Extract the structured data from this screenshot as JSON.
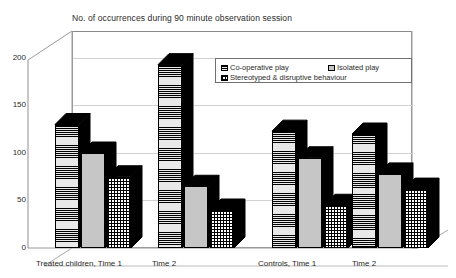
{
  "chart_data": {
    "type": "bar",
    "title": "No. of occurrences during 90 minute observation session",
    "xlabel": "",
    "ylabel": "",
    "ylim": [
      0,
      200
    ],
    "yticks": [
      0,
      50,
      100,
      150,
      200
    ],
    "grid": true,
    "legend_position": "top-right-inside",
    "style": "3d-clustered-column",
    "categories": [
      "Treated children, Time 1",
      "Time 2",
      "Controls, Time 1",
      "Time 2"
    ],
    "series": [
      {
        "name": "Co-operative play",
        "pattern": "horizontal-lines",
        "values": [
          130,
          193,
          123,
          120
        ]
      },
      {
        "name": "Isolated play",
        "pattern": "solid-grey",
        "values": [
          100,
          65,
          95,
          78
        ]
      },
      {
        "name": "Stereotyped & disruptive behaviour",
        "pattern": "checkered",
        "values": [
          75,
          40,
          45,
          62
        ]
      }
    ]
  },
  "legend": {
    "items": [
      {
        "label": "Co-operative play"
      },
      {
        "label": "Isolated play"
      },
      {
        "label": "Stereotyped & disruptive behaviour"
      }
    ]
  },
  "axis": {
    "y_tick_labels": [
      "200",
      "150",
      "100",
      "50",
      "0"
    ]
  }
}
